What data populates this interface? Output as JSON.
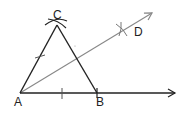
{
  "diagram": {
    "type": "geometric-construction",
    "points": {
      "A": {
        "label": "A",
        "x": 20,
        "y": 93
      },
      "B": {
        "label": "B",
        "x": 97,
        "y": 93
      },
      "C": {
        "label": "C",
        "x": 57,
        "y": 25
      },
      "D": {
        "label": "D",
        "x": 123,
        "y": 30
      }
    },
    "labels": {
      "A": "A",
      "B": "B",
      "C": "C",
      "D": "D"
    },
    "colors": {
      "triangle": "#222222",
      "ray": "#888888"
    }
  }
}
